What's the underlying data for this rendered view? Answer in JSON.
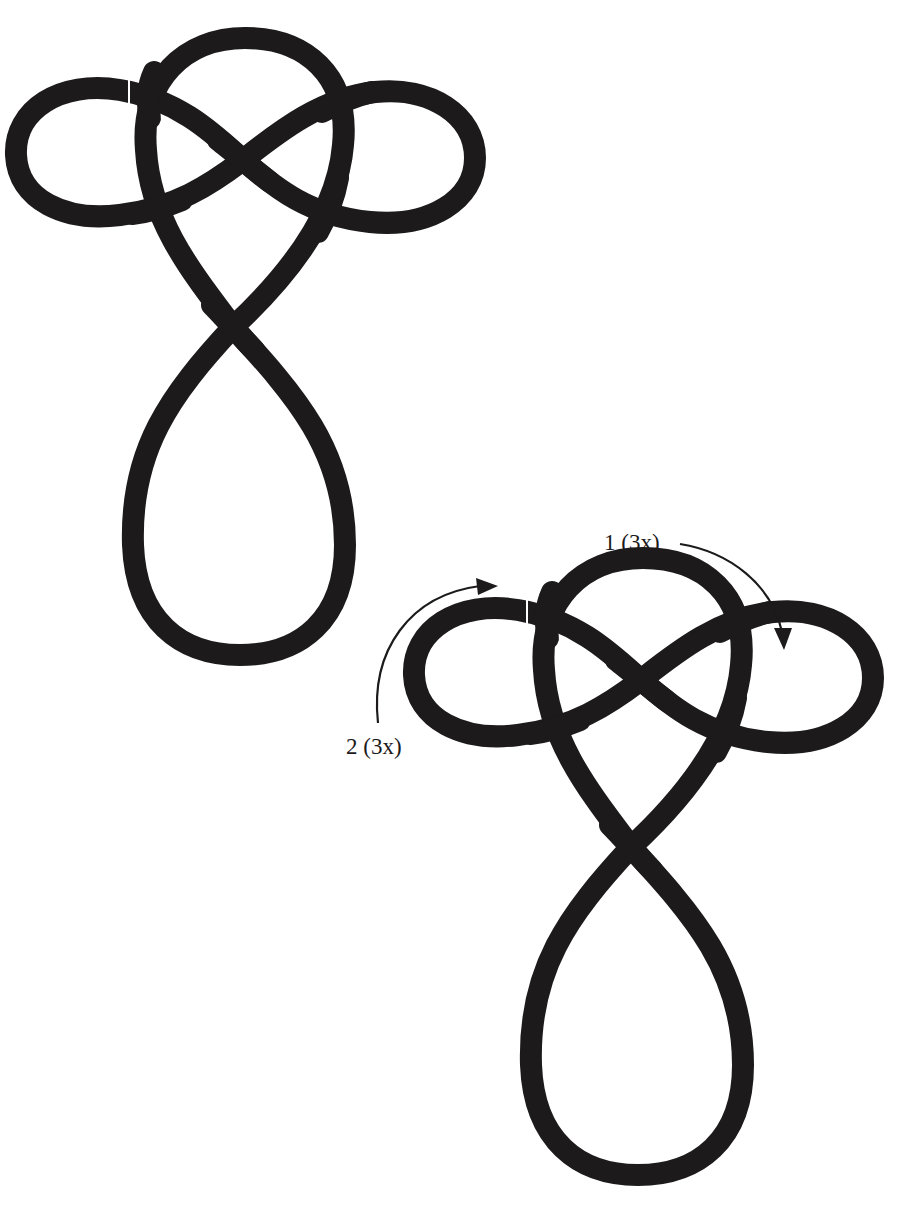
{
  "figure": {
    "colors": {
      "rope": "#1c1a1a",
      "background": "#ffffff"
    },
    "knots": [
      {
        "id": "knot-1",
        "position": "top-left",
        "annotated": false
      },
      {
        "id": "knot-2",
        "position": "bottom-right",
        "annotated": true
      }
    ],
    "annotations": [
      {
        "id": "step-1",
        "label": "1 (3x)",
        "arrow_direction": "clockwise-down-right",
        "target": "right ear loop"
      },
      {
        "id": "step-2",
        "label": "2 (3x)",
        "arrow_direction": "clockwise-up-right",
        "target": "left ear loop"
      }
    ]
  }
}
